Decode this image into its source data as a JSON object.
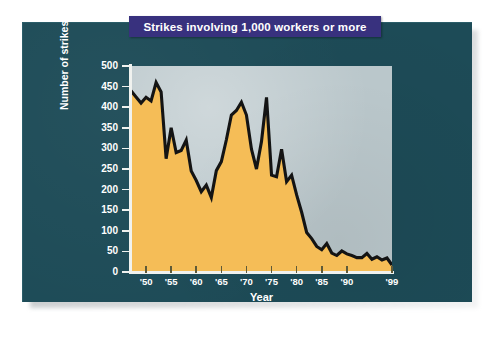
{
  "card": {
    "background_color": "#1d4b57"
  },
  "title": {
    "text": "Strikes involving 1,000 workers or more",
    "bar_color": "#38317e",
    "text_color": "#ffffff"
  },
  "axis_title_x": "Year",
  "axis_title_y": "Number of strikes",
  "chart_data": {
    "type": "area",
    "title": "Strikes involving 1,000 workers or more",
    "xlabel": "Year",
    "ylabel": "Number of strikes",
    "xlim": [
      1947,
      1999
    ],
    "ylim": [
      0,
      500
    ],
    "ytick_values": [
      0,
      50,
      100,
      150,
      200,
      250,
      300,
      350,
      400,
      450,
      500
    ],
    "ytick_labels": [
      "0",
      "50",
      "100",
      "150",
      "200",
      "250",
      "300",
      "350",
      "400",
      "450",
      "500"
    ],
    "xtick_values": [
      1950,
      1955,
      1960,
      1965,
      1970,
      1975,
      1980,
      1985,
      1990,
      1999
    ],
    "xtick_labels": [
      "'50",
      "'55",
      "'60",
      "'65",
      "'70",
      "'75",
      "'80",
      "'85",
      "'90",
      "'99"
    ],
    "grid": false,
    "legend": "none",
    "fill_color": "#f5bd57",
    "line_color": "#141414",
    "plot_background_color": "#bac7cb",
    "x": [
      1947,
      1948,
      1949,
      1950,
      1951,
      1952,
      1953,
      1954,
      1955,
      1956,
      1957,
      1958,
      1959,
      1960,
      1961,
      1962,
      1963,
      1964,
      1965,
      1966,
      1967,
      1968,
      1969,
      1970,
      1971,
      1972,
      1973,
      1974,
      1975,
      1976,
      1977,
      1978,
      1979,
      1980,
      1981,
      1982,
      1983,
      1984,
      1985,
      1986,
      1987,
      1988,
      1989,
      1990,
      1991,
      1992,
      1993,
      1994,
      1995,
      1996,
      1997,
      1998,
      1999
    ],
    "values": [
      440,
      425,
      410,
      424,
      415,
      460,
      437,
      275,
      350,
      290,
      295,
      320,
      245,
      222,
      195,
      211,
      181,
      246,
      268,
      321,
      381,
      392,
      412,
      381,
      298,
      250,
      317,
      424,
      235,
      231,
      298,
      219,
      235,
      187,
      145,
      96,
      81,
      62,
      54,
      69,
      46,
      40,
      51,
      44,
      40,
      35,
      35,
      45,
      31,
      37,
      29,
      34,
      17
    ],
    "annotations": []
  }
}
